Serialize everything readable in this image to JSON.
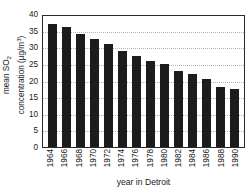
{
  "chart_data": {
    "type": "bar",
    "title": "",
    "subtitle": "",
    "xlabel": "year in Detroit",
    "ylabel_line1": "mean SO",
    "ylabel_sub": "2",
    "ylabel_line2_pre": "concentration (µg/m",
    "ylabel_sup": "3",
    "ylabel_line2_post": ")",
    "ylabel_full": "mean SO2 concentration (µg/m3)",
    "categories": [
      "1964",
      "1966",
      "1968",
      "1970",
      "1972",
      "1974",
      "1976",
      "1978",
      "1980",
      "1982",
      "1984",
      "1986",
      "1988",
      "1990"
    ],
    "values": [
      37,
      36,
      34,
      32.5,
      31,
      29,
      27.5,
      26,
      25,
      23,
      22,
      20.5,
      18,
      17.5
    ],
    "ylim": [
      0,
      40
    ],
    "yticks": [
      0,
      5,
      10,
      15,
      20,
      25,
      30,
      35,
      40
    ],
    "ytick_labels": [
      "0",
      "5",
      "10",
      "15",
      "20",
      "25",
      "30",
      "35",
      "40"
    ],
    "grid": true,
    "grid_axis": "y",
    "grid_style": "dotted",
    "legend": "none",
    "bar_color": "#1c1c1c",
    "axis_color": "#2a2a2a",
    "grid_color": "#b4b4b4",
    "background": "#ffffff",
    "series": [
      {
        "name": "mean SO2 concentration",
        "values": [
          37,
          36,
          34,
          32.5,
          31,
          29,
          27.5,
          26,
          25,
          23,
          22,
          20.5,
          18,
          17.5
        ]
      }
    ]
  },
  "figure": {
    "x_axis_title": "year in Detroit",
    "bottom_artifact": ""
  }
}
